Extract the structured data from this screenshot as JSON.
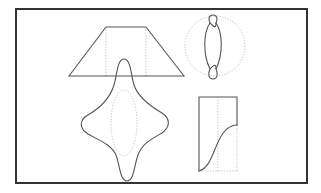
{
  "figure": {
    "colors": {
      "background": "#ffffff",
      "frame": "#333333",
      "solid_stroke": "#555555",
      "dotted_stroke": "#b9b9b9"
    },
    "frame": {
      "x": 16,
      "y": 9,
      "width": 291,
      "height": 174
    },
    "shapes": [
      {
        "id": "trapezoid",
        "label": "Trapezoid with dotted vertical guides"
      },
      {
        "id": "twisted-loop",
        "label": "Twisted figure-eight loop in dotted circle"
      },
      {
        "id": "four-point-star",
        "label": "Curved four-pointed star with dotted inner ellipse"
      },
      {
        "id": "s-curve-box",
        "label": "Rectangle with S-curve and dotted edges"
      }
    ]
  }
}
